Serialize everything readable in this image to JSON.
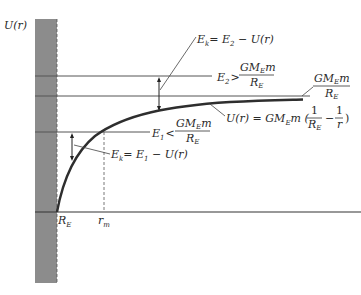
{
  "diagram": {
    "y_axis_label": "U(r)",
    "x_ticks": [
      {
        "main": "R",
        "sub": "E"
      },
      {
        "main": "r",
        "sub": "m"
      }
    ],
    "labels": {
      "ek2": {
        "lhs": "E",
        "lhs_sub": "k",
        "rhs": "= E",
        "rhs_sub": "2",
        "tail": " − U(r)"
      },
      "e2": {
        "lhs": "E",
        "lhs_sub": "2",
        "op": ">",
        "num_a": "GM",
        "num_sub": "E",
        "num_b": "m",
        "den": "R",
        "den_sub": "E"
      },
      "asymptote": {
        "num_a": "GM",
        "num_sub": "E",
        "num_b": "m",
        "den": "R",
        "den_sub": "E"
      },
      "curve": {
        "lhs": "U(r) = GM",
        "lhs_sub": "E",
        "mid": "m (",
        "f1_num": "1",
        "f1_den": "R",
        "f1_den_sub": "E",
        "minus": "−",
        "f2_num": "1",
        "f2_den": "r",
        "close": ")"
      },
      "e1": {
        "lhs": "E",
        "lhs_sub": "1",
        "op": "<",
        "num_a": "GM",
        "num_sub": "E",
        "num_b": "m",
        "den": "R",
        "den_sub": "E"
      },
      "ek1": {
        "lhs": "E",
        "lhs_sub": "k",
        "rhs": "= E",
        "rhs_sub": "1",
        "tail": " − U(r)"
      }
    },
    "colors": {
      "earth_fill": "#8a8a8a",
      "line": "#3a3a3a",
      "curve": "#2e2e2e"
    }
  }
}
